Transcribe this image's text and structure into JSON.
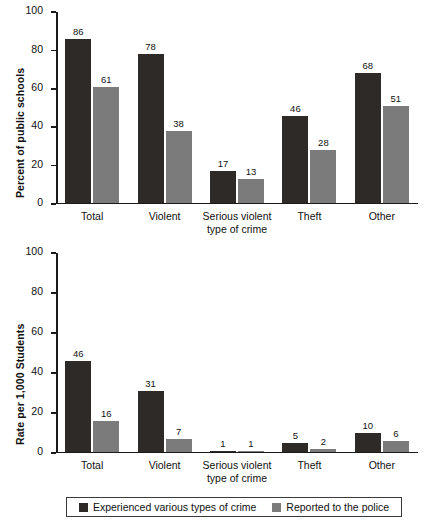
{
  "chart_data": [
    {
      "id": "top",
      "type": "bar",
      "title": "",
      "xlabel": "type of crime",
      "ylabel": "Percent of public schools",
      "ylim": [
        0,
        100
      ],
      "yticks": [
        0,
        20,
        40,
        60,
        80,
        100
      ],
      "grid": false,
      "categories": [
        "Total",
        "Violent",
        "Serious violent",
        "Theft",
        "Other"
      ],
      "series": [
        {
          "name": "Experienced various types of crime",
          "color": "#2e2a27",
          "values": [
            86,
            78,
            17,
            46,
            68
          ]
        },
        {
          "name": "Reported to the police",
          "color": "#7b7b7b",
          "values": [
            61,
            38,
            13,
            28,
            51
          ]
        }
      ]
    },
    {
      "id": "bottom",
      "type": "bar",
      "title": "",
      "xlabel": "type of crime",
      "ylabel": "Rate per 1,000 Students",
      "ylim": [
        0,
        100
      ],
      "yticks": [
        0,
        20,
        40,
        60,
        80,
        100
      ],
      "grid": false,
      "categories": [
        "Total",
        "Violent",
        "Serious violent",
        "Theft",
        "Other"
      ],
      "series": [
        {
          "name": "Experienced various types of crime",
          "color": "#2e2a27",
          "values": [
            46,
            31,
            1,
            5,
            10
          ]
        },
        {
          "name": "Reported to the police",
          "color": "#7b7b7b",
          "values": [
            16,
            7,
            1,
            2,
            6
          ]
        }
      ]
    }
  ],
  "top_chart": {
    "ylabel": "Percent of public schools",
    "yticks": [
      "100",
      "80",
      "60",
      "40",
      "20",
      "0"
    ],
    "categories": [
      {
        "line1": "Total",
        "line2": ""
      },
      {
        "line1": "Violent",
        "line2": ""
      },
      {
        "line1": "Serious violent",
        "line2": "type of crime"
      },
      {
        "line1": "Theft",
        "line2": ""
      },
      {
        "line1": "Other",
        "line2": ""
      }
    ],
    "values_dark": [
      "86",
      "78",
      "17",
      "46",
      "68"
    ],
    "values_light": [
      "61",
      "38",
      "13",
      "28",
      "51"
    ]
  },
  "bottom_chart": {
    "ylabel": "Rate per 1,000 Students",
    "yticks": [
      "100",
      "80",
      "60",
      "40",
      "20",
      "0"
    ],
    "categories": [
      {
        "line1": "Total",
        "line2": ""
      },
      {
        "line1": "Violent",
        "line2": ""
      },
      {
        "line1": "Serious violent",
        "line2": "type of crime"
      },
      {
        "line1": "Theft",
        "line2": ""
      },
      {
        "line1": "Other",
        "line2": ""
      }
    ],
    "values_dark": [
      "46",
      "31",
      "1",
      "5",
      "10"
    ],
    "values_light": [
      "16",
      "7",
      "1",
      "2",
      "6"
    ]
  },
  "legend": {
    "items": [
      {
        "label": "Experienced various types of crime",
        "color": "#2e2a27"
      },
      {
        "label": "Reported to the police",
        "color": "#7b7b7b"
      }
    ]
  },
  "colors": {
    "dark_series": "#2e2a27",
    "light_series": "#7b7b7b",
    "axis": "#1a1a1a",
    "background": "#ffffff"
  }
}
